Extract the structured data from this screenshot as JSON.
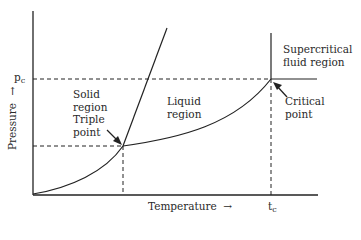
{
  "diagram": {
    "type": "phase-diagram",
    "axes": {
      "x_label": "Temperature",
      "x_arrow": "→",
      "y_label": "Pressure",
      "y_arrow": "→",
      "x_tick": {
        "main": "t",
        "sub": "c"
      },
      "y_tick": {
        "main": "p",
        "sub": "c"
      }
    },
    "regions": {
      "solid": [
        "Solid",
        "region"
      ],
      "liquid": [
        "Liquid",
        "region"
      ],
      "supercritical": [
        "Supercritical",
        "fluid region"
      ]
    },
    "points": {
      "triple": [
        "Triple",
        "point"
      ],
      "critical": [
        "Critical",
        "point"
      ]
    },
    "colors": {
      "line": "#222222",
      "background": "#ffffff"
    }
  }
}
